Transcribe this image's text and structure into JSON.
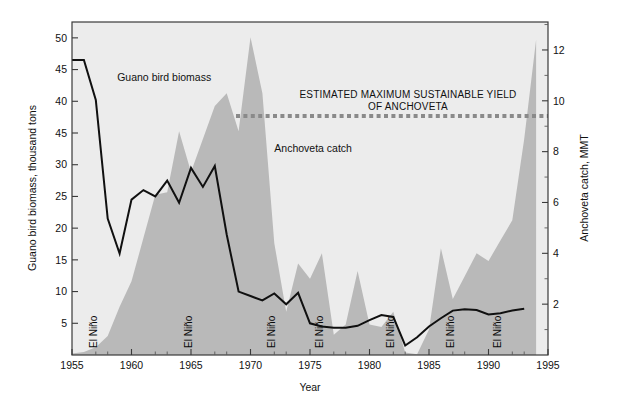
{
  "chart_data": {
    "type": "area",
    "title": "",
    "xlabel": "Year",
    "xlim": [
      1955,
      1995
    ],
    "xticks": [
      1955,
      1960,
      1965,
      1970,
      1975,
      1980,
      1985,
      1990,
      1995
    ],
    "grid": false,
    "legend_position": "inline-annotations",
    "axes": [
      {
        "id": "left",
        "label": "Guano bird biomass, thousand tons",
        "ylim": [
          0,
          52.5
        ],
        "ticks": [
          5,
          10,
          15,
          20,
          25,
          30,
          35,
          40,
          45,
          50
        ],
        "tick_labels": [
          "5",
          "10",
          "15",
          "20",
          "25",
          "30",
          "45",
          "40",
          "45",
          "50"
        ]
      },
      {
        "id": "right",
        "label": "Anchoveta catch, MMT",
        "ylim": [
          0,
          13.1
        ],
        "ticks": [
          2,
          4,
          6,
          8,
          10,
          12
        ],
        "tick_labels": [
          "2",
          "4",
          "6",
          "8",
          "10",
          "12"
        ]
      }
    ],
    "series": [
      {
        "name": "Guano bird biomass",
        "type": "line",
        "axis": "left",
        "unit": "thousand tons",
        "color": "#101010",
        "x": [
          1955,
          1956,
          1957,
          1958,
          1959,
          1960,
          1961,
          1962,
          1963,
          1964,
          1965,
          1966,
          1967,
          1968,
          1969,
          1970,
          1971,
          1972,
          1973,
          1974,
          1975,
          1976,
          1977,
          1978,
          1979,
          1980,
          1981,
          1982,
          1983,
          1984,
          1985,
          1986,
          1987,
          1988,
          1989,
          1990,
          1991,
          1992,
          1993
        ],
        "values": [
          46.5,
          46.5,
          40.2,
          21.5,
          16.0,
          24.5,
          26.0,
          25.0,
          27.5,
          24.0,
          29.5,
          26.5,
          29.8,
          19.0,
          10.0,
          9.3,
          8.6,
          9.7,
          8.0,
          9.8,
          5.0,
          4.5,
          4.3,
          4.3,
          4.6,
          5.5,
          6.3,
          6.0,
          1.5,
          2.8,
          4.5,
          5.8,
          7.0,
          7.2,
          7.1,
          6.4,
          6.6,
          7.0,
          7.3
        ]
      },
      {
        "name": "Anchoveta catch",
        "type": "area",
        "axis": "right",
        "unit": "MMT",
        "color": "#b9b9b9",
        "x": [
          1955,
          1956,
          1957,
          1958,
          1959,
          1960,
          1961,
          1962,
          1963,
          1964,
          1965,
          1966,
          1967,
          1968,
          1969,
          1970,
          1971,
          1972,
          1973,
          1974,
          1975,
          1976,
          1977,
          1978,
          1979,
          1980,
          1981,
          1982,
          1983,
          1984,
          1985,
          1986,
          1987,
          1988,
          1989,
          1990,
          1991,
          1992,
          1993,
          1994
        ],
        "values": [
          0.06,
          0.12,
          0.3,
          0.75,
          1.9,
          2.9,
          4.6,
          6.3,
          6.4,
          8.8,
          7.2,
          8.5,
          9.8,
          10.3,
          8.8,
          12.5,
          10.3,
          4.4,
          1.7,
          3.6,
          3.0,
          4.0,
          0.8,
          1.2,
          3.3,
          1.2,
          1.1,
          1.7,
          0.1,
          0.03,
          1.0,
          4.2,
          2.2,
          3.1,
          4.0,
          3.7,
          4.5,
          5.3,
          8.5,
          12.4
        ]
      }
    ],
    "annotations": [
      {
        "name": "msy-line",
        "type": "hline",
        "axis": "right",
        "value": 9.4,
        "label": "ESTIMATED MAXIMUM SUSTAINABLE YIELD OF ANCHOVETA",
        "label_line1": "ESTIMATED MAXIMUM SUSTAINABLE YIELD",
        "label_line2": "OF ANCHOVETA",
        "color": "#8a8a8a",
        "style": "dotted"
      },
      {
        "name": "bird-series-label",
        "type": "text",
        "text": "Guano bird biomass",
        "x": 1958.8,
        "y_left": 43.2
      },
      {
        "name": "catch-series-label",
        "type": "text",
        "text": "Anchoveta catch",
        "x": 1972.0,
        "y_left": 32.0
      }
    ],
    "event_markers": {
      "label": "El Niño",
      "name": "el-nino-marker",
      "years": [
        1957,
        1965,
        1972,
        1976,
        1982,
        1987,
        1991
      ]
    }
  },
  "figure": {
    "plot_background": "#ececec",
    "page_background": "#ffffff",
    "frame_color": "#3a3a3a"
  }
}
